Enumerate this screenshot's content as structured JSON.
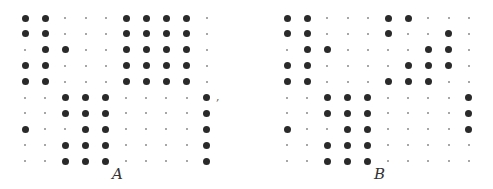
{
  "figure": {
    "separator": ",",
    "matrices": [
      {
        "label": "A",
        "rows": [
          [
            1,
            1,
            0,
            0,
            0,
            1,
            1,
            1,
            1,
            0
          ],
          [
            1,
            1,
            0,
            0,
            0,
            1,
            1,
            1,
            1,
            0
          ],
          [
            0,
            1,
            1,
            0,
            0,
            1,
            1,
            1,
            1,
            0
          ],
          [
            1,
            1,
            0,
            0,
            0,
            1,
            1,
            1,
            1,
            0
          ],
          [
            1,
            1,
            0,
            0,
            0,
            1,
            1,
            1,
            1,
            0
          ],
          [
            0,
            0,
            1,
            1,
            1,
            0,
            0,
            0,
            0,
            1
          ],
          [
            0,
            0,
            1,
            1,
            1,
            0,
            0,
            0,
            0,
            1
          ],
          [
            1,
            0,
            0,
            1,
            1,
            0,
            0,
            0,
            0,
            1
          ],
          [
            0,
            0,
            1,
            1,
            1,
            0,
            0,
            0,
            0,
            1
          ],
          [
            0,
            0,
            1,
            1,
            1,
            0,
            0,
            0,
            0,
            1
          ]
        ]
      },
      {
        "label": "B",
        "rows": [
          [
            1,
            1,
            0,
            0,
            0,
            1,
            1,
            0,
            0,
            0
          ],
          [
            1,
            1,
            0,
            0,
            0,
            1,
            0,
            0,
            1,
            0
          ],
          [
            0,
            1,
            1,
            0,
            0,
            0,
            0,
            1,
            1,
            0
          ],
          [
            1,
            1,
            0,
            0,
            0,
            0,
            1,
            1,
            1,
            0
          ],
          [
            1,
            1,
            0,
            0,
            0,
            1,
            1,
            1,
            0,
            0
          ],
          [
            0,
            0,
            1,
            1,
            1,
            0,
            0,
            0,
            0,
            1
          ],
          [
            0,
            0,
            1,
            1,
            1,
            0,
            0,
            0,
            0,
            1
          ],
          [
            1,
            0,
            0,
            1,
            1,
            0,
            0,
            0,
            0,
            1
          ],
          [
            0,
            0,
            1,
            1,
            1,
            0,
            0,
            0,
            0,
            0
          ],
          [
            0,
            0,
            1,
            1,
            1,
            0,
            0,
            0,
            0,
            0
          ]
        ]
      }
    ]
  }
}
